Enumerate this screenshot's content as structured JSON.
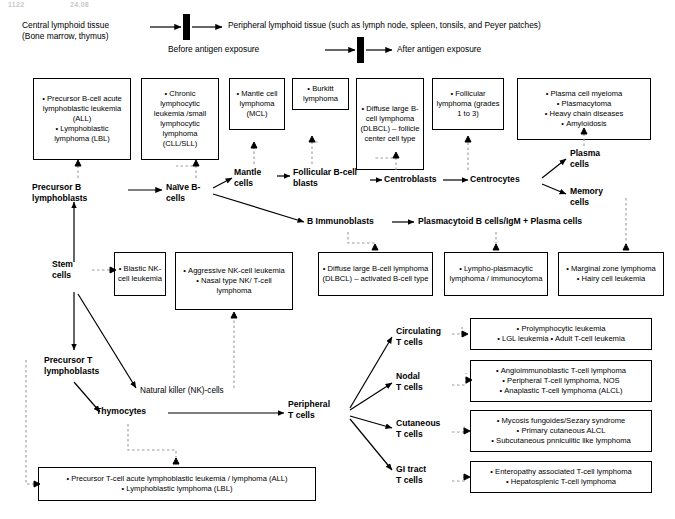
{
  "page_header": {
    "left": "1122",
    "right": "24.08"
  },
  "legend": {
    "central_label": "Central lymphoid tissue\n(Bone marrow, thymus)",
    "peripheral_label": "Peripheral lymphoid tissue (such as lymph node, spleen, tonsils, and Peyer patches)",
    "before_label": "Before antigen exposure",
    "after_label": "After antigen exposure"
  },
  "boxes": {
    "precursor_b_neoplasms": [
      "Precursor B-cell acute lymphoblastic leukemia (ALL)",
      "Lymphoblastic lymphoma (LBL)"
    ],
    "cll_sll": [
      "Chronic lymphocytic leukemia /small lymphocytic lymphoma (CLL/SLL)"
    ],
    "mantle_cell_lymphoma": [
      "Mantle cell lymphoma (MCL)"
    ],
    "burkitt_lymphoma": [
      "Burkitt lymphoma"
    ],
    "dlbcl_follicle_center": [
      "Diffuse large B-cell lymphoma (DLBCL) – follicle center cell type"
    ],
    "follicular_lymphoma": [
      "Follicular lymphoma (grades 1 to 3)"
    ],
    "plasma_cell_neoplasms": [
      "Plasma cell myeloma",
      "Plasmacytoma",
      "Heavy chain diseases",
      "Amyloidosis"
    ],
    "blastic_nk": [
      "Blastic NK-cell leukemia"
    ],
    "aggressive_nk": [
      "Aggressive NK-cell leukemia",
      "Nasal type NK/ T-cell lymphoma"
    ],
    "dlbcl_activated": [
      "Diffuse large B-cell lymphoma (DLBCL) – activated B-cell type"
    ],
    "lymphoplasmacytic": [
      "Lympho-plasmacytic lymphoma / immunocytoma"
    ],
    "marginal_zone": [
      "Marginal zone lymphoma",
      "Hairy cell leukemia"
    ],
    "circulating_t_neoplasms": [
      "Prolymphocytic leukemia",
      "LGL leukemia • Adult T-cell leukemia"
    ],
    "nodal_t_neoplasms": [
      "Angioimmunoblastic T-cell lymphoma",
      "Peripheral T-cell lymphoma, NOS",
      "Anaplastic T-cell lymphoma (ALCL)"
    ],
    "cutaneous_t_neoplasms": [
      "Mycosis fungoides/Sezary syndrome",
      "Primary cutaneous ALCL",
      "Subcutaneous pnniculitic like lymphoma"
    ],
    "gi_t_neoplasms": [
      "Enteropathy associated T-cell lymphoma",
      "Hepatosplenic T-cell lymphoma"
    ],
    "precursor_t_neoplasms": [
      "Precursor T-cell acute lymphoblastic leukemia / lymphoma (ALL)",
      "Lymphoblastic lymphoma (LBL)"
    ]
  },
  "flow_labels": {
    "precursor_b_lymphoblasts": "Precursor B\nlymphoblasts",
    "naive_b_cells": "Naïve B-\ncells",
    "mantle_cells": "Mantle\ncells",
    "follicular_b_cell_blasts": "Follicular B-cell\nblasts",
    "centroblasts": "Centroblasts",
    "centrocytes": "Centrocytes",
    "plasma_cells": "Plasma\ncells",
    "memory_cells": "Memory\ncells",
    "b_immunoblasts": "B Immunoblasts",
    "plasmacytoid_b_cells": "Plasmacytoid B cells/IgM + Plasma cells",
    "stem_cells": "Stem\ncells",
    "precursor_t_lymphoblasts": "Precursor T\nlymphoblasts",
    "natural_killer_cells": "Natural killer (NK)-cells",
    "thymocytes": "Thymocytes",
    "peripheral_t_cells": "Peripheral\nT cells",
    "circulating_t_cells": "Circulating\nT cells",
    "nodal_t_cells": "Nodal\nT cells",
    "cutaneous_t_cells": "Cutaneous\nT cells",
    "gi_tract_t_cells": "GI tract\nT cells"
  },
  "colors": {
    "line": "#000000",
    "dashed": "#999999",
    "background": "#ffffff"
  }
}
